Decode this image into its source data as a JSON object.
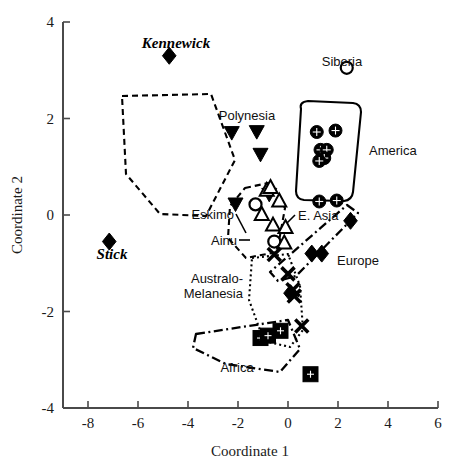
{
  "chart_data": {
    "type": "scatter",
    "title": "",
    "xlabel": "Coordinate 1",
    "ylabel": "Coordinate 2",
    "xlim": [
      -9,
      6
    ],
    "ylim": [
      -4,
      4
    ],
    "xticks": [
      -8,
      -6,
      -4,
      -2,
      0,
      2,
      4,
      6
    ],
    "yticks": [
      -4,
      -2,
      0,
      2,
      4
    ],
    "xticklabels": [
      "-8",
      "-6",
      "-4",
      "-2",
      "0",
      "2",
      "4",
      "6"
    ],
    "yticklabels": [
      "-4",
      "-2",
      "0",
      "2",
      "4"
    ],
    "grid": false,
    "legend": "none (inline group annotations)",
    "series": [
      {
        "name": "Kennewick",
        "marker": "filled-diamond",
        "label_style": "bold-italic",
        "points": [
          [
            -4.75,
            3.3
          ]
        ]
      },
      {
        "name": "Stick",
        "marker": "filled-diamond",
        "label_style": "bold-italic",
        "points": [
          [
            -7.15,
            -0.55
          ]
        ]
      },
      {
        "name": "Siberia",
        "marker": "open-circle",
        "points": [
          [
            2.35,
            3.05
          ]
        ]
      },
      {
        "name": "Polynesia",
        "marker": "filled-down-triangle",
        "hull": "dashed",
        "points": [
          [
            -2.25,
            1.7
          ],
          [
            -1.25,
            1.72
          ],
          [
            -1.1,
            1.25
          ],
          [
            -2.1,
            0.22
          ],
          [
            -0.75,
            0.42
          ]
        ]
      },
      {
        "name": "America",
        "marker": "circle-with-cross",
        "hull": "solid",
        "points": [
          [
            1.15,
            1.72
          ],
          [
            1.9,
            1.75
          ],
          [
            1.3,
            1.35
          ],
          [
            1.55,
            1.35
          ],
          [
            1.45,
            1.18
          ],
          [
            1.25,
            1.12
          ],
          [
            1.25,
            0.28
          ],
          [
            1.95,
            0.3
          ]
        ]
      },
      {
        "name": "Eskimo",
        "marker": "open-circle",
        "points": [
          [
            -1.3,
            0.22
          ]
        ]
      },
      {
        "name": "Ainu",
        "marker": "open-circle",
        "points": [
          [
            -0.55,
            -0.55
          ]
        ]
      },
      {
        "name": "E. Asia",
        "marker": "open-up-triangle",
        "hull": "dashed",
        "points": [
          [
            -0.85,
            0.52
          ],
          [
            -0.35,
            0.3
          ],
          [
            -1.05,
            0.02
          ],
          [
            -0.6,
            -0.2
          ],
          [
            -0.1,
            -0.25
          ],
          [
            -0.15,
            -0.57
          ],
          [
            -0.7,
            0.58
          ]
        ]
      },
      {
        "name": "Europe",
        "marker": "filled-diamond",
        "hull": "dashdot",
        "points": [
          [
            2.5,
            -0.12
          ],
          [
            0.95,
            -0.8
          ],
          [
            1.35,
            -0.8
          ],
          [
            0.1,
            -1.62
          ]
        ]
      },
      {
        "name": "Australo-Melanesia",
        "marker": "x",
        "hull": "dotted",
        "points": [
          [
            -0.55,
            -0.82
          ],
          [
            0.0,
            -1.22
          ],
          [
            0.2,
            -1.55
          ],
          [
            0.25,
            -1.68
          ],
          [
            0.55,
            -2.3
          ]
        ]
      },
      {
        "name": "Africa",
        "marker": "filled-square",
        "hull": "dashdot",
        "points": [
          [
            -1.1,
            -2.55
          ],
          [
            -0.8,
            -2.5
          ],
          [
            -0.3,
            -2.4
          ],
          [
            0.9,
            -3.3
          ]
        ]
      }
    ]
  },
  "annotations": {
    "kennewick": "Kennewick",
    "stick": "Stick",
    "siberia": "Siberia",
    "polynesia": "Polynesia",
    "america": "America",
    "eskimo": "Eskimo",
    "ainu": "Ainu",
    "e_asia": "E. Asia",
    "europe": "Europe",
    "australo": "Australo-",
    "melanesia": "Melanesia",
    "africa": "Africa"
  },
  "axes": {
    "x_title": "Coordinate 1",
    "y_title": "Coordinate 2"
  },
  "colors": {
    "marker": "#000000",
    "axis": "#4a4a4a",
    "background": "#ffffff"
  }
}
